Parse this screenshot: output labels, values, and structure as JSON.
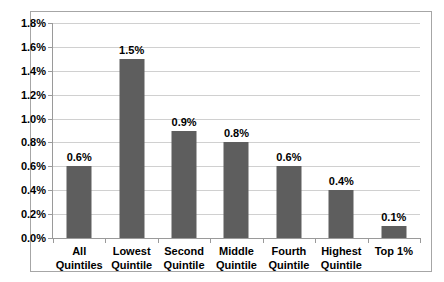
{
  "chart_data": {
    "type": "bar",
    "title": "",
    "subtitle": "",
    "xlabel": "",
    "ylabel": "",
    "categories": [
      "All\nQuintiles",
      "Lowest\nQuintile",
      "Second\nQuintile",
      "Middle\nQuintile",
      "Fourth\nQuintile",
      "Highest\nQuintile",
      "Top 1%"
    ],
    "category_lines": [
      [
        "All",
        "Quintiles"
      ],
      [
        "Lowest",
        "Quintile"
      ],
      [
        "Second",
        "Quintile"
      ],
      [
        "Middle",
        "Quintile"
      ],
      [
        "Fourth",
        "Quintile"
      ],
      [
        "Highest",
        "Quintile"
      ],
      [
        "Top 1%"
      ]
    ],
    "values": [
      0.6,
      1.5,
      0.9,
      0.8,
      0.6,
      0.4,
      0.1
    ],
    "data_labels": [
      "0.6%",
      "1.5%",
      "0.9%",
      "0.8%",
      "0.6%",
      "0.4%",
      "0.1%"
    ],
    "ylim": [
      0.0,
      1.8
    ],
    "ytick_step": 0.2,
    "ytick_labels": [
      "0.0%",
      "0.2%",
      "0.4%",
      "0.6%",
      "0.8%",
      "1.0%",
      "1.2%",
      "1.4%",
      "1.6%",
      "1.8%"
    ],
    "ytick_values": [
      0.0,
      0.2,
      0.4,
      0.6,
      0.8,
      1.0,
      1.2,
      1.4,
      1.6,
      1.8
    ],
    "grid": true,
    "grid_axis": "y",
    "legend": false,
    "legend_position": "none",
    "series": [
      {
        "name": "",
        "values": [
          0.6,
          1.5,
          0.9,
          0.8,
          0.6,
          0.4,
          0.1
        ]
      }
    ],
    "colors": {
      "bar_fill": "#5e5e5e",
      "gridline": "#d0d0d0",
      "axis_line": "#9a9a9a",
      "frame_border": "#a6a6a6",
      "plot_background": "#ffffff",
      "text": "#000000"
    }
  }
}
